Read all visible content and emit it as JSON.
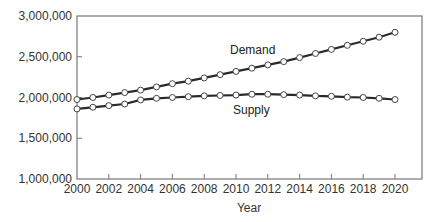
{
  "chart_data": {
    "type": "line",
    "title": "",
    "xlabel": "Year",
    "ylabel": "",
    "xlim": [
      2000,
      2021.7
    ],
    "ylim": [
      1000000,
      3000000
    ],
    "grid": false,
    "legend": "inline labels",
    "x_ticks": [
      "2000",
      "2002",
      "2004",
      "2006",
      "2008",
      "2010",
      "2012",
      "2014",
      "2016",
      "2018",
      "2020"
    ],
    "y_ticks": [
      "1,000,000",
      "1,500,000",
      "2,000,000",
      "2,500,000",
      "3,000,000"
    ],
    "x": [
      2000,
      2001,
      2002,
      2003,
      2004,
      2005,
      2006,
      2007,
      2008,
      2009,
      2010,
      2011,
      2012,
      2013,
      2014,
      2015,
      2016,
      2017,
      2018,
      2019,
      2020
    ],
    "series": [
      {
        "name": "Demand",
        "values": [
          1975000,
          2000000,
          2030000,
          2060000,
          2090000,
          2130000,
          2170000,
          2200000,
          2240000,
          2280000,
          2320000,
          2360000,
          2400000,
          2440000,
          2490000,
          2540000,
          2590000,
          2640000,
          2690000,
          2740000,
          2800000
        ]
      },
      {
        "name": "Supply",
        "values": [
          1860000,
          1880000,
          1900000,
          1920000,
          1970000,
          1990000,
          2000000,
          2010000,
          2020000,
          2025000,
          2030000,
          2040000,
          2040000,
          2035000,
          2030000,
          2020000,
          2015000,
          2005000,
          2000000,
          1990000,
          1975000
        ]
      }
    ],
    "annotations": [
      {
        "text": "Demand",
        "x": 2010.5,
        "y": 2610000
      },
      {
        "text": "Supply",
        "x": 2010.5,
        "y": 1860000
      }
    ]
  },
  "labels": {
    "xlabel": "Year",
    "demand": "Demand",
    "supply": "Supply"
  }
}
